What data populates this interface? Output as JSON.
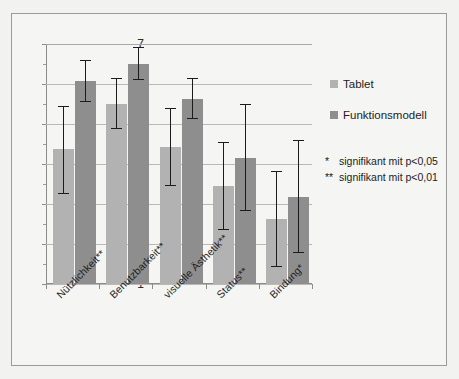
{
  "chart_data": {
    "type": "bar",
    "title": "",
    "subtitle": "",
    "xlabel": "",
    "ylabel": "",
    "ylim": [
      1,
      7
    ],
    "yticks": [
      1,
      2,
      3,
      4,
      5,
      6,
      7
    ],
    "ytick_labels": [
      "1",
      "2",
      "3",
      "4",
      "5",
      "6",
      "7"
    ],
    "grid": true,
    "legend_position": "right",
    "categories": [
      "Nützlichkeit**",
      "Benutzbarkeit**",
      "visuelle Ästhetik**",
      "Status**",
      "Bindung*"
    ],
    "series": [
      {
        "name": "Tablet",
        "color": "#b2b2b2",
        "values": [
          4.37,
          5.51,
          4.42,
          3.45,
          2.62
        ],
        "error_low": [
          3.26,
          4.88,
          3.46,
          2.35,
          1.43
        ],
        "error_high": [
          5.45,
          6.14,
          5.4,
          4.55,
          3.82
        ]
      },
      {
        "name": "Funktionsmodell",
        "color": "#8e8e8e",
        "values": [
          6.07,
          6.5,
          5.62,
          4.16,
          3.17
        ],
        "error_low": [
          5.55,
          6.09,
          5.12,
          2.83,
          1.78
        ],
        "error_high": [
          6.6,
          6.92,
          6.14,
          5.5,
          4.6
        ]
      }
    ],
    "annotations": [
      {
        "mark": "*",
        "text": "signifikant mit p<0,05"
      },
      {
        "mark": "**",
        "text": "signifikant mit p<0,01"
      }
    ]
  },
  "legend": {
    "items": [
      {
        "label": "Tablet",
        "color": "#b2b2b2"
      },
      {
        "label": "Funktionsmodell",
        "color": "#8e8e8e"
      }
    ]
  }
}
